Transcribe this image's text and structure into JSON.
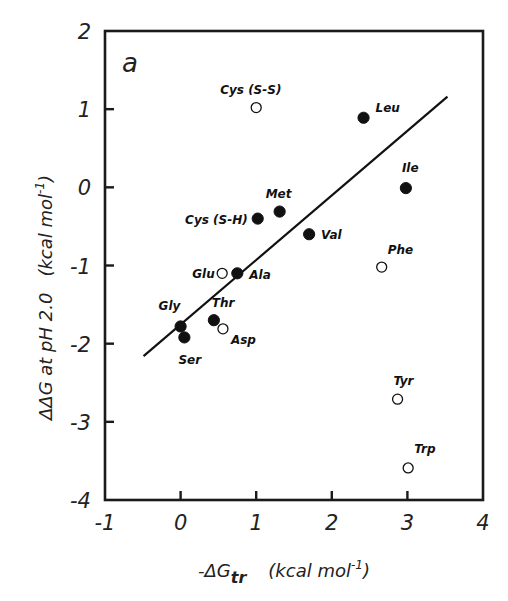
{
  "chart_data": {
    "type": "scatter",
    "title": "",
    "panel_label": "a",
    "xlabel": "-ΔGtr (kcal mol⁻¹)",
    "xlabel_parts": {
      "prefix": "-ΔG",
      "subscript": "tr",
      "units": "(kcal mol",
      "sup": "-1",
      "close": ")"
    },
    "ylabel": "ΔΔG at pH 2.0  (kcal mol⁻¹)",
    "ylabel_parts": {
      "main": "ΔΔG at pH 2.0",
      "units": "(kcal mol",
      "sup": "-1",
      "close": ")"
    },
    "xlim": [
      -1,
      4
    ],
    "ylim": [
      -4,
      2
    ],
    "xticks": [
      -1,
      0,
      1,
      2,
      3,
      4
    ],
    "yticks": [
      -4,
      -3,
      -2,
      -1,
      0,
      1,
      2
    ],
    "xtick_labels": [
      "-1",
      "0",
      "1",
      "2",
      "3",
      "4"
    ],
    "ytick_labels": [
      "-4",
      "-3",
      "-2",
      "-1",
      "0",
      "1",
      "2"
    ],
    "grid": false,
    "legend": null,
    "series": [
      {
        "name": "filled",
        "marker": "filled-circle",
        "points": [
          {
            "label": "Leu",
            "x": 2.42,
            "y": 0.89
          },
          {
            "label": "Ile",
            "x": 2.98,
            "y": -0.01
          },
          {
            "label": "Met",
            "x": 1.31,
            "y": -0.31
          },
          {
            "label": "Cys (S-H)",
            "x": 1.02,
            "y": -0.4
          },
          {
            "label": "Val",
            "x": 1.7,
            "y": -0.6
          },
          {
            "label": "Ala",
            "x": 0.75,
            "y": -1.1
          },
          {
            "label": "Thr",
            "x": 0.44,
            "y": -1.7
          },
          {
            "label": "Gly",
            "x": 0.0,
            "y": -1.78
          },
          {
            "label": "Ser",
            "x": 0.05,
            "y": -1.92
          }
        ]
      },
      {
        "name": "open",
        "marker": "open-circle",
        "points": [
          {
            "label": "Cys (S-S)",
            "x": 1.0,
            "y": 1.02
          },
          {
            "label": "Glu",
            "x": 0.55,
            "y": -1.1
          },
          {
            "label": "Asp",
            "x": 0.56,
            "y": -1.81
          },
          {
            "label": "Phe",
            "x": 2.66,
            "y": -1.02
          },
          {
            "label": "Tyr",
            "x": 2.87,
            "y": -2.71
          },
          {
            "label": "Trp",
            "x": 3.01,
            "y": -3.59
          }
        ]
      }
    ],
    "fit_line": {
      "x1": -0.49,
      "y1": -2.16,
      "x2": 3.53,
      "y2": 1.16
    }
  },
  "label_offsets": {
    "Leu": [
      12,
      -6,
      "start"
    ],
    "Ile": [
      -4,
      -16,
      "start"
    ],
    "Met": [
      -14,
      -14,
      "start"
    ],
    "Cys (S-H)": [
      -10,
      5,
      "end"
    ],
    "Val": [
      12,
      5,
      "start"
    ],
    "Ala": [
      12,
      6,
      "start"
    ],
    "Thr": [
      -2,
      -13,
      "start"
    ],
    "Gly": [
      -22,
      -16,
      "start"
    ],
    "Ser": [
      -6,
      27,
      "start"
    ],
    "Cys (S-S)": [
      -36,
      -14,
      "start"
    ],
    "Glu": [
      -30,
      5,
      "start"
    ],
    "Asp": [
      8,
      15,
      "start"
    ],
    "Phe": [
      6,
      -13,
      "start"
    ],
    "Tyr": [
      -4,
      -14,
      "start"
    ],
    "Trp": [
      6,
      -15,
      "start"
    ]
  }
}
